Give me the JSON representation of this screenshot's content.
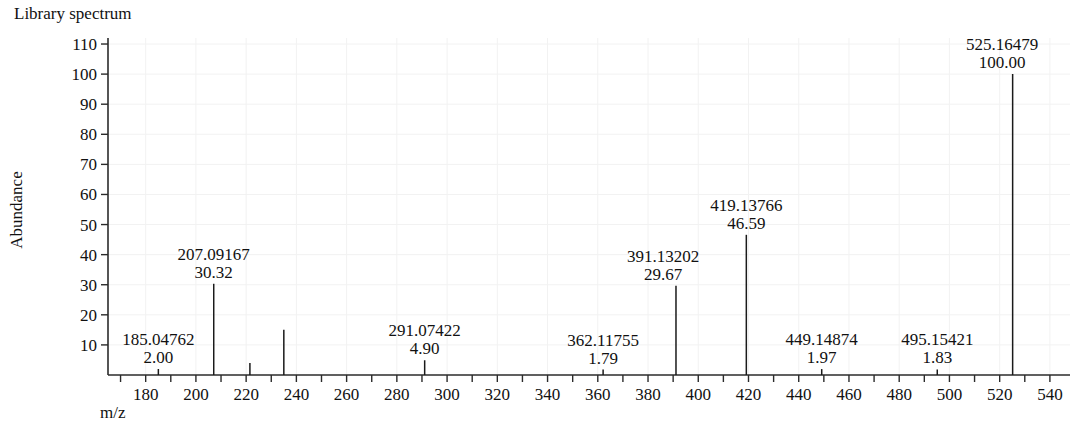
{
  "chart_data": {
    "type": "bar",
    "title": "Library spectrum",
    "xlabel": "m/z",
    "ylabel": "Abundance",
    "xlim": [
      165,
      548
    ],
    "ylim": [
      0,
      112
    ],
    "grid": true,
    "legend": "none",
    "x_ticks": [
      170,
      180,
      190,
      200,
      210,
      220,
      230,
      240,
      250,
      260,
      270,
      280,
      290,
      300,
      310,
      320,
      330,
      340,
      350,
      360,
      370,
      380,
      390,
      400,
      410,
      420,
      430,
      440,
      450,
      460,
      470,
      480,
      490,
      500,
      510,
      520,
      530,
      540
    ],
    "x_tick_labels": [
      {
        "value": 180,
        "label": "180"
      },
      {
        "value": 200,
        "label": "200"
      },
      {
        "value": 220,
        "label": "220"
      },
      {
        "value": 240,
        "label": "240"
      },
      {
        "value": 260,
        "label": "260"
      },
      {
        "value": 280,
        "label": "280"
      },
      {
        "value": 300,
        "label": "300"
      },
      {
        "value": 320,
        "label": "320"
      },
      {
        "value": 340,
        "label": "340"
      },
      {
        "value": 360,
        "label": "360"
      },
      {
        "value": 380,
        "label": "380"
      },
      {
        "value": 400,
        "label": "400"
      },
      {
        "value": 420,
        "label": "420"
      },
      {
        "value": 440,
        "label": "440"
      },
      {
        "value": 460,
        "label": "460"
      },
      {
        "value": 480,
        "label": "480"
      },
      {
        "value": 500,
        "label": "500"
      },
      {
        "value": 520,
        "label": "520"
      },
      {
        "value": 540,
        "label": "540"
      }
    ],
    "y_ticks": [
      10,
      20,
      30,
      40,
      50,
      60,
      70,
      80,
      90,
      100,
      110
    ],
    "y_tick_labels": [
      "10",
      "20",
      "30",
      "40",
      "50",
      "60",
      "70",
      "80",
      "90",
      "100",
      "110"
    ],
    "peaks": [
      {
        "mz": 185.04762,
        "abundance": 2.0,
        "mz_label": "185.04762",
        "abundance_label": "2.00",
        "labeled": true,
        "label_x": 185.04762,
        "label_anchor": "middle",
        "label_dy": 0
      },
      {
        "mz": 207.09167,
        "abundance": 30.32,
        "mz_label": "207.09167",
        "abundance_label": "30.32",
        "labeled": true,
        "label_x": 207.09167,
        "label_anchor": "middle",
        "label_dy": 0
      },
      {
        "mz": 221.5,
        "abundance": 4.0,
        "mz_label": "",
        "abundance_label": "",
        "labeled": false
      },
      {
        "mz": 235.0,
        "abundance": 15.0,
        "mz_label": "",
        "abundance_label": "",
        "labeled": false
      },
      {
        "mz": 291.07422,
        "abundance": 4.9,
        "mz_label": "291.07422",
        "abundance_label": "4.90",
        "labeled": true,
        "label_x": 291.07422,
        "label_anchor": "middle",
        "label_dy": 0
      },
      {
        "mz": 362.11755,
        "abundance": 1.79,
        "mz_label": "362.11755",
        "abundance_label": "1.79",
        "labeled": true,
        "label_x": 362.11755,
        "label_anchor": "middle",
        "label_dy": 0
      },
      {
        "mz": 391.13202,
        "abundance": 29.67,
        "mz_label": "391.13202",
        "abundance_label": "29.67",
        "labeled": true,
        "label_x": 386.0,
        "label_anchor": "middle",
        "label_dy": 0
      },
      {
        "mz": 419.13766,
        "abundance": 46.59,
        "mz_label": "419.13766",
        "abundance_label": "46.59",
        "labeled": true,
        "label_x": 419.13766,
        "label_anchor": "middle",
        "label_dy": 0
      },
      {
        "mz": 449.14874,
        "abundance": 1.97,
        "mz_label": "449.14874",
        "abundance_label": "1.97",
        "labeled": true,
        "label_x": 449.14874,
        "label_anchor": "middle",
        "label_dy": 0
      },
      {
        "mz": 495.15421,
        "abundance": 1.83,
        "mz_label": "495.15421",
        "abundance_label": "1.83",
        "labeled": true,
        "label_x": 495.15421,
        "label_anchor": "middle",
        "label_dy": 0
      },
      {
        "mz": 525.16479,
        "abundance": 100.0,
        "mz_label": "525.16479",
        "abundance_label": "100.00",
        "labeled": true,
        "label_x": 521.0,
        "label_anchor": "middle",
        "label_dy": 0
      }
    ]
  },
  "colors": {
    "axis": "#2b2b2b",
    "peak": "#1a1a1a",
    "text": "#111111",
    "grid": "#f2f2f2",
    "background": "#ffffff"
  }
}
